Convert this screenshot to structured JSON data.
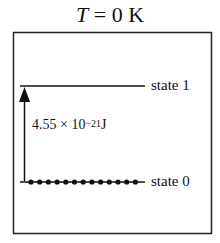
{
  "title": {
    "variable": "T",
    "equals": " = ",
    "value": "0 K"
  },
  "diagram": {
    "type": "energy-level",
    "levels": [
      {
        "name": "state 1",
        "label": "state 1",
        "population": 0
      },
      {
        "name": "state 0",
        "label": "state 0",
        "population": 13
      }
    ],
    "transition": {
      "from": "state 0",
      "to": "state 1",
      "energy_mantissa": "4.55 × 10",
      "energy_exponent": "−21",
      "energy_unit": "J"
    },
    "colors": {
      "line": "#111111",
      "background": "#ffffff"
    }
  }
}
